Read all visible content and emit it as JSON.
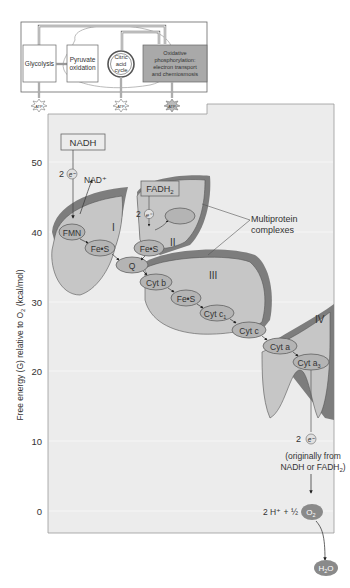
{
  "inset": {
    "steps": [
      {
        "id": "glycolysis",
        "label": "Glycolysis"
      },
      {
        "id": "pyruvate",
        "label_lines": [
          "Pyruvate",
          "oxidation"
        ]
      },
      {
        "id": "citric",
        "label_lines": [
          "Citric",
          "acid",
          "cycle"
        ]
      },
      {
        "id": "oxphos",
        "label_lines": [
          "Oxidative",
          "phosphorylation:",
          "electron transport",
          "and chemiosmosis"
        ],
        "highlight_color": "#a9a9a9"
      }
    ],
    "atp_label": "ATP"
  },
  "chart": {
    "ylabel_parts": [
      "Free energy (G) relative to O",
      "2",
      " (kcal/mol)"
    ],
    "yticks": [
      "50",
      "40",
      "30",
      "20",
      "10",
      "0"
    ],
    "panel_color": "#ececec"
  },
  "labels": {
    "nadh": "NADH",
    "nad_plus": "NAD⁺",
    "fadh2": [
      "FADH",
      "2"
    ],
    "fad": "FAD",
    "two": "2",
    "electron": "e⁻",
    "multiprotein": [
      "Multiprotein",
      "complexes"
    ],
    "complexes": [
      "I",
      "II",
      "III",
      "IV"
    ],
    "carriers": {
      "fmn": "FMN",
      "fes1": "Fe•S",
      "fes2": "Fe•S",
      "fes3": "Fe•S",
      "q": "Q",
      "cytb": "Cyt b",
      "cytc1": "Cyt c",
      "cytc": "Cyt c",
      "cyta": "Cyt a",
      "cyta3": "Cyt a"
    },
    "origin_note": [
      "(originally from",
      "NADH or FADH"
    ],
    "origin_sub": "2",
    "origin_close": ")",
    "proton_eq": "2 H⁺ + ½",
    "o2": "O",
    "o2_sub": "2",
    "h2o_h": "H",
    "h2o_sub": "2",
    "h2o_o": "O"
  },
  "colors": {
    "complex_fill": "#c6c6c6",
    "complex_dark": "#7d7d7d",
    "complex_mid": "#9c9c9c",
    "carrier_fill": "#b4b4b4",
    "o2_fill": "#8a8a8a"
  }
}
